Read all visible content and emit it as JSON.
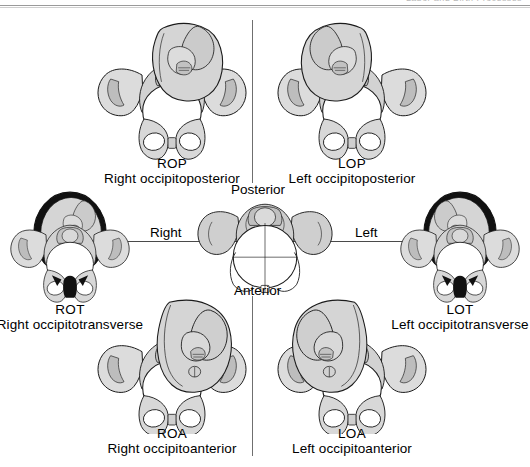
{
  "page": {
    "running_head": "Labor and Birth Processes",
    "background": "#ffffff",
    "width": 530,
    "height": 467
  },
  "center": {
    "name": "pelvis-compass",
    "posterior_label": "Posterior",
    "anterior_label": "Anterior",
    "right_label": "Right",
    "left_label": "Left"
  },
  "positions": [
    {
      "id": "rop",
      "abbr": "ROP",
      "full": "Right occipitoposterior",
      "variant": "light"
    },
    {
      "id": "lop",
      "abbr": "LOP",
      "full": "Left occipitoposterior",
      "variant": "light"
    },
    {
      "id": "rot",
      "abbr": "ROT",
      "full": "Right occipitotransverse",
      "variant": "dark"
    },
    {
      "id": "lot",
      "abbr": "LOT",
      "full": "Left occipitotransverse",
      "variant": "dark"
    },
    {
      "id": "roa",
      "abbr": "ROA",
      "full": "Right occipitoanterior",
      "variant": "light"
    },
    {
      "id": "loa",
      "abbr": "LOA",
      "full": "Left occipitoanterior",
      "variant": "light"
    }
  ],
  "colors": {
    "ink": "#1b1b1b",
    "bone_light": "#e3e3e3",
    "bone_mid": "#c9c9c9",
    "bone_dark": "#a8a8a8",
    "fetus_fill": "#d5d5d5",
    "fetus_shade": "#bdbdbd",
    "outline_dark": "#111111",
    "rule": "#4a4a4a",
    "running_head": "#b9b9b9"
  }
}
